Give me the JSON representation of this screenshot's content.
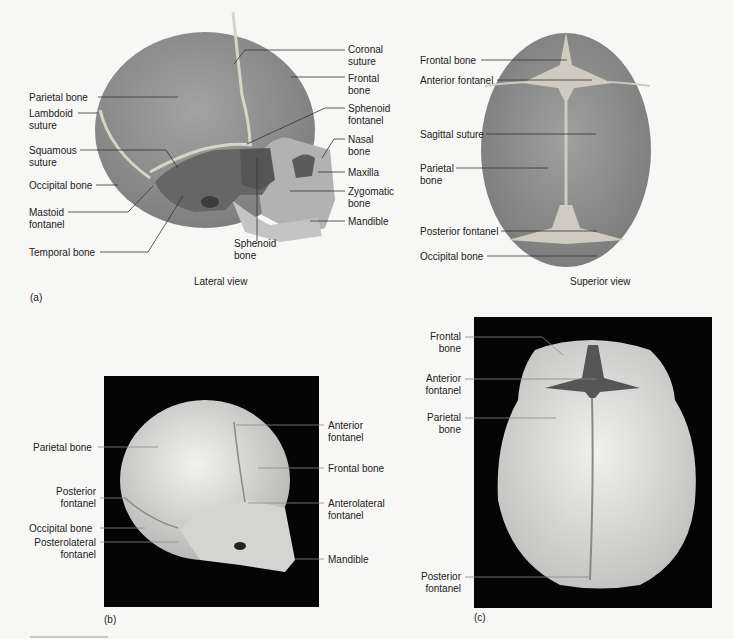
{
  "panel_a": {
    "tag": "(a)",
    "lateral": {
      "caption": "Lateral view",
      "left_labels": [
        {
          "id": "parietal-bone",
          "text": "Parietal bone"
        },
        {
          "id": "lambdoid-suture",
          "text": "Lambdoid\nsuture"
        },
        {
          "id": "squamous-suture",
          "text": "Squamous\nsuture"
        },
        {
          "id": "occipital-bone",
          "text": "Occipital bone"
        },
        {
          "id": "mastoid-fontanel",
          "text": "Mastoid\nfontanel"
        },
        {
          "id": "temporal-bone",
          "text": "Temporal bone"
        }
      ],
      "right_labels": [
        {
          "id": "coronal-suture",
          "text": "Coronal\nsuture"
        },
        {
          "id": "frontal-bone",
          "text": "Frontal\nbone"
        },
        {
          "id": "sphenoid-fontanel",
          "text": "Sphenoid\nfontanel"
        },
        {
          "id": "nasal-bone",
          "text": "Nasal\nbone"
        },
        {
          "id": "maxilla",
          "text": "Maxilla"
        },
        {
          "id": "zygomatic-bone",
          "text": "Zygomatic\nbone"
        },
        {
          "id": "mandible",
          "text": "Mandible"
        }
      ],
      "bottom_labels": [
        {
          "id": "sphenoid-bone",
          "text": "Sphenoid\nbone"
        }
      ]
    },
    "superior": {
      "caption": "Superior view",
      "labels": [
        {
          "id": "frontal-bone",
          "text": "Frontal bone"
        },
        {
          "id": "anterior-fontanel",
          "text": "Anterior fontanel"
        },
        {
          "id": "sagittal-suture",
          "text": "Sagittal suture"
        },
        {
          "id": "parietal-bone",
          "text": "Parietal\nbone"
        },
        {
          "id": "posterior-fontanel",
          "text": "Posterior fontanel"
        },
        {
          "id": "occipital-bone",
          "text": "Occipital bone"
        }
      ]
    }
  },
  "panel_b": {
    "tag": "(b)",
    "left_labels": [
      {
        "id": "parietal-bone",
        "text": "Parietal bone"
      },
      {
        "id": "posterior-fontanel",
        "text": "Posterior\nfontanel"
      },
      {
        "id": "occipital-bone",
        "text": "Occipital bone"
      },
      {
        "id": "posterolateral-fontanel",
        "text": "Posterolateral\nfontanel"
      }
    ],
    "right_labels": [
      {
        "id": "anterior-fontanel",
        "text": "Anterior\nfontanel"
      },
      {
        "id": "frontal-bone",
        "text": "Frontal bone"
      },
      {
        "id": "anterolateral-fontanel",
        "text": "Anterolateral\nfontanel"
      },
      {
        "id": "mandible",
        "text": "Mandible"
      }
    ]
  },
  "panel_c": {
    "tag": "(c)",
    "labels": [
      {
        "id": "frontal-bone",
        "text": "Frontal\nbone"
      },
      {
        "id": "anterior-fontanel",
        "text": "Anterior\nfontanel"
      },
      {
        "id": "parietal-bone",
        "text": "Parietal\nbone"
      },
      {
        "id": "posterior-fontanel",
        "text": "Posterior\nfontanel"
      }
    ]
  },
  "colors": {
    "illustration_bone": "#8f8f8f",
    "illustration_dark": "#5e5e5e",
    "suture": "#d8d4c8",
    "photo_bg": "#050505",
    "photo_bone": "#e4e4e2",
    "leader": "#333333"
  }
}
